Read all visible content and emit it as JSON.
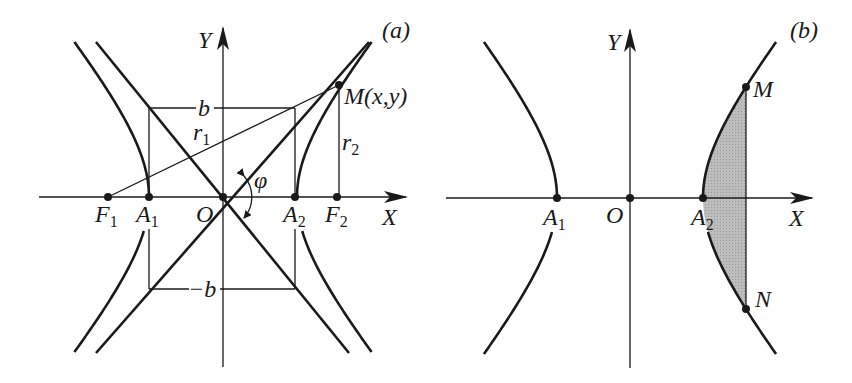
{
  "panels": [
    {
      "id": "a",
      "label": "(a)",
      "origin": [
        223,
        197
      ],
      "a": 74,
      "b": 89,
      "x_axis": {
        "from": 39,
        "to": 406,
        "label": "X"
      },
      "y_axis": {
        "from": 367,
        "to": 28,
        "label": "Y"
      },
      "points": {
        "O": "O",
        "A1": "A",
        "A2": "A",
        "F1": "F",
        "F2": "F",
        "M": "M(x,y)"
      },
      "labels": {
        "b": "b",
        "neg_b": "−b",
        "r1": "r",
        "r2": "r",
        "phi": "φ",
        "sub1": "1",
        "sub2": "2"
      },
      "focus_x_offset": 114,
      "M_point": [
        339,
        85
      ]
    },
    {
      "id": "b",
      "label": "(b)",
      "origin": [
        630,
        198
      ],
      "a": 73,
      "b": 90,
      "x_axis": {
        "from": 446,
        "to": 812,
        "label": "X"
      },
      "y_axis": {
        "from": 368,
        "to": 30,
        "label": "Y"
      },
      "points": {
        "O": "O",
        "A1": "A",
        "A2": "A",
        "M": "M",
        "N": "N"
      },
      "labels": {
        "sub1": "1",
        "sub2": "2"
      },
      "chord_x": 746,
      "shade_color": "#b5b5b5"
    }
  ]
}
